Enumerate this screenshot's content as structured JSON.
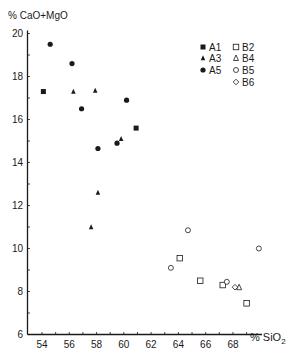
{
  "chart_data": {
    "type": "scatter",
    "title": "",
    "xlabel": "% SiO2",
    "ylabel": "% CaO+MgO",
    "xlim": [
      53,
      70.2
    ],
    "ylim": [
      6,
      20
    ],
    "xticks": [
      54,
      56,
      58,
      60,
      62,
      64,
      66,
      68
    ],
    "yticks": [
      6,
      8,
      10,
      12,
      14,
      16,
      18,
      20
    ],
    "grid": false,
    "legend_position": "upper right",
    "series": [
      {
        "name": "A1",
        "marker": "square",
        "filled": true,
        "points": [
          [
            54.1,
            17.3
          ],
          [
            60.9,
            15.6
          ]
        ]
      },
      {
        "name": "A3",
        "marker": "triangle",
        "filled": true,
        "points": [
          [
            56.3,
            17.3
          ],
          [
            57.9,
            17.35
          ],
          [
            59.8,
            15.1
          ],
          [
            58.1,
            12.6
          ],
          [
            57.6,
            11.0
          ]
        ]
      },
      {
        "name": "A5",
        "marker": "circle",
        "filled": true,
        "points": [
          [
            54.6,
            19.5
          ],
          [
            56.2,
            18.6
          ],
          [
            60.2,
            16.9
          ],
          [
            56.9,
            16.5
          ],
          [
            59.5,
            14.9
          ],
          [
            58.1,
            14.65
          ]
        ]
      },
      {
        "name": "B2",
        "marker": "square",
        "filled": false,
        "points": [
          [
            64.1,
            9.55
          ],
          [
            65.6,
            8.5
          ],
          [
            67.25,
            8.3
          ],
          [
            69.0,
            7.45
          ]
        ]
      },
      {
        "name": "B4",
        "marker": "triangle",
        "filled": false,
        "points": [
          [
            68.45,
            8.2
          ]
        ]
      },
      {
        "name": "B5",
        "marker": "circle",
        "filled": false,
        "points": [
          [
            64.7,
            10.85
          ],
          [
            69.9,
            10.0
          ],
          [
            63.45,
            9.1
          ],
          [
            67.55,
            8.45
          ]
        ]
      },
      {
        "name": "B6",
        "marker": "diamond",
        "filled": false,
        "points": [
          [
            68.15,
            8.2
          ]
        ]
      }
    ]
  },
  "axes": {
    "x_label_main": "% SiO",
    "x_label_sub": "2",
    "y_label": "% CaO+MgO"
  },
  "legend": {
    "entries": [
      "A1",
      "A3",
      "A5",
      "B2",
      "B4",
      "B5",
      "B6"
    ]
  }
}
